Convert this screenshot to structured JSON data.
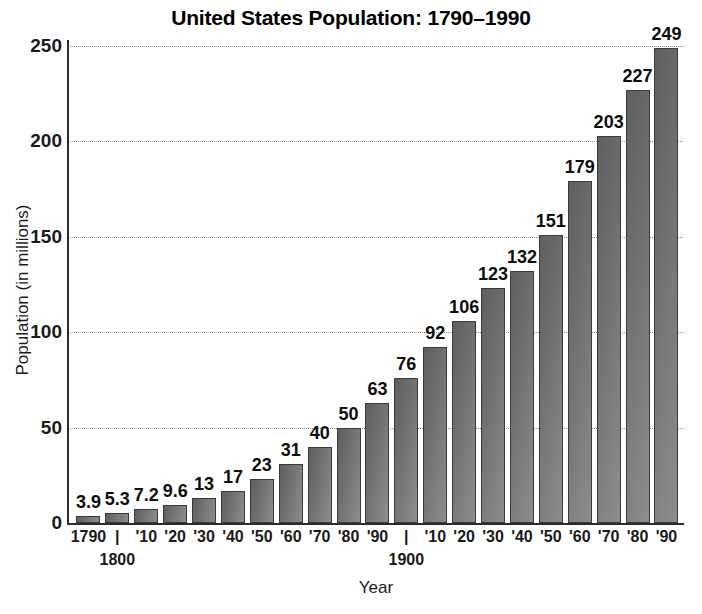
{
  "chart_data": {
    "type": "bar",
    "title": "United States Population: 1790–1990",
    "xlabel": "Year",
    "ylabel": "Population (in millions)",
    "ylim": [
      0,
      250
    ],
    "yticks": [
      0,
      50,
      100,
      150,
      200,
      250
    ],
    "ytick_labels": [
      "0",
      "50",
      "100",
      "150",
      "200",
      "250"
    ],
    "grid": true,
    "grid_axis": "y",
    "legend": "none",
    "categories": [
      "1790",
      "1800",
      "1810",
      "1820",
      "1830",
      "1840",
      "1850",
      "1860",
      "1870",
      "1880",
      "1890",
      "1900",
      "1910",
      "1920",
      "1930",
      "1940",
      "1950",
      "1960",
      "1970",
      "1980",
      "1990"
    ],
    "xtick_labels": [
      "1790",
      "|",
      "'10",
      "'20",
      "'30",
      "'40",
      "'50",
      "'60",
      "'70",
      "'80",
      "'90",
      "|",
      "'10",
      "'20",
      "'30",
      "'40",
      "'50",
      "'60",
      "'70",
      "'80",
      "'90"
    ],
    "xtick_sublabels": [
      "",
      "1800",
      "",
      "",
      "",
      "",
      "",
      "",
      "",
      "",
      "",
      "1900",
      "",
      "",
      "",
      "",
      "",
      "",
      "",
      "",
      ""
    ],
    "values": [
      3.9,
      5.3,
      7.2,
      9.6,
      13,
      17,
      23,
      31,
      40,
      50,
      63,
      76,
      92,
      106,
      123,
      132,
      151,
      179,
      203,
      227,
      249
    ],
    "value_labels": [
      "3.9",
      "5.3",
      "7.2",
      "9.6",
      "13",
      "17",
      "23",
      "31",
      "40",
      "50",
      "63",
      "76",
      "92",
      "106",
      "123",
      "132",
      "151",
      "179",
      "203",
      "227",
      "249"
    ],
    "bar_color": "#6e6e6e",
    "bar_edge_color": "#3a3a3a",
    "grid_color": "#8a8a8a",
    "axis_color": "#2b2b2b",
    "text_color": "#111111"
  }
}
